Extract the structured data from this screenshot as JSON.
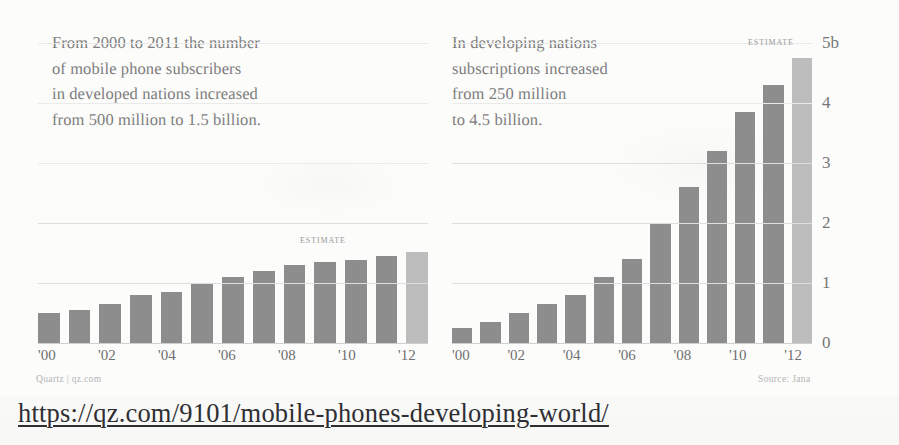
{
  "url_line": "https://qz.com/9101/mobile-phones-developing-world/",
  "panels": {
    "left": {
      "blurb": "From 2000 to 2011 the number\nof mobile phone subscribers\nin developed nations increased\nfrom 500 million to 1.5 billion.",
      "estimate_label": "ESTIMATE",
      "credit": "Quartz | qz.com"
    },
    "right": {
      "blurb": "In developing nations\nsubscriptions increased\nfrom 250 million\nto 4.5 billion.",
      "estimate_label": "ESTIMATE",
      "credit": "Source: Jana"
    }
  },
  "axis": {
    "y_ticks": [
      "5b",
      "4",
      "3",
      "2",
      "1",
      "0"
    ],
    "x_ticks": [
      "'00",
      "",
      "'02",
      "",
      "'04",
      "",
      "'06",
      "",
      "'08",
      "",
      "'10",
      "",
      "'12"
    ]
  },
  "chart_data": [
    {
      "type": "bar",
      "title": "Mobile phone subscribers in developed nations",
      "xlabel": "",
      "ylabel": "Subscribers (billions)",
      "ylim": [
        0,
        5
      ],
      "grid": true,
      "legend": "none",
      "categories": [
        "2000",
        "2001",
        "2002",
        "2003",
        "2004",
        "2005",
        "2006",
        "2007",
        "2008",
        "2009",
        "2010",
        "2011",
        "2012"
      ],
      "tick_labels": [
        "'00",
        "",
        "'02",
        "",
        "'04",
        "",
        "'06",
        "",
        "'08",
        "",
        "'10",
        "",
        "'12"
      ],
      "values": [
        0.5,
        0.55,
        0.65,
        0.8,
        0.85,
        1.0,
        1.1,
        1.2,
        1.3,
        1.35,
        1.38,
        1.45,
        1.52
      ],
      "annotations": [
        {
          "text": "ESTIMATE",
          "applies_to": "2012",
          "note": "final bar shown lighter as projection"
        }
      ],
      "bar_color": "#8d8d8d",
      "estimate_bar_color": "#bdbdbd",
      "estimate_index": 12
    },
    {
      "type": "bar",
      "title": "Mobile phone subscriptions in developing nations",
      "xlabel": "",
      "ylabel": "Subscriptions (billions)",
      "ylim": [
        0,
        5
      ],
      "grid": true,
      "legend": "none",
      "categories": [
        "2000",
        "2001",
        "2002",
        "2003",
        "2004",
        "2005",
        "2006",
        "2007",
        "2008",
        "2009",
        "2010",
        "2011",
        "2012"
      ],
      "tick_labels": [
        "'00",
        "",
        "'02",
        "",
        "'04",
        "",
        "'06",
        "",
        "'08",
        "",
        "'10",
        "",
        "'12"
      ],
      "values": [
        0.25,
        0.35,
        0.5,
        0.65,
        0.8,
        1.1,
        1.4,
        2.0,
        2.6,
        3.2,
        3.85,
        4.3,
        4.75
      ],
      "annotations": [
        {
          "text": "ESTIMATE",
          "applies_to": "2012",
          "note": "final bar shown lighter as projection"
        }
      ],
      "bar_color": "#8d8d8d",
      "estimate_bar_color": "#bdbdbd",
      "estimate_index": 12
    }
  ]
}
